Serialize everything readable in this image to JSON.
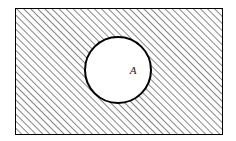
{
  "figure": {
    "background_color": "#ffffff",
    "outer_region": {
      "name": "hatched-rectangle",
      "shape": "rectangle",
      "x": 15,
      "y": 8,
      "width": 207,
      "height": 126,
      "stroke_color": "#000000",
      "stroke_width": 1,
      "fill": "diagonal-hatch",
      "hatch": {
        "angle_degrees": 45,
        "direction": "lower-left-to-upper-right",
        "spacing": 5,
        "line_width": 1,
        "line_color": "#2b2b2b",
        "background_color": "#ffffff"
      }
    },
    "inner_region": {
      "name": "circle-A",
      "shape": "circle",
      "center_x": 118,
      "center_y": 70,
      "radius": 33,
      "stroke_color": "#000000",
      "stroke_width": 2,
      "fill_color": "#ffffff",
      "label": "A",
      "label_x": 133,
      "label_y": 71,
      "label_style": "italic-serif",
      "label_color": "#1a1a1a"
    }
  }
}
